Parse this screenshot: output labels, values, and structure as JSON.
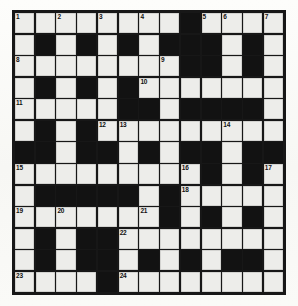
{
  "puzzle": {
    "title": "Crossword Grid",
    "size": {
      "columns": 13,
      "rows": 13
    },
    "colors": {
      "block": "#121212",
      "open_cell": "#ededea",
      "border": "#171717",
      "number_text": "#101010",
      "page_background": "#fbfbf9"
    },
    "legend": {
      "block_label": "blocked-square",
      "open_label": "open-square"
    },
    "clue_numbers": [
      {
        "number": "1",
        "row": 0,
        "col": 0
      },
      {
        "number": "2",
        "row": 0,
        "col": 2
      },
      {
        "number": "3",
        "row": 0,
        "col": 4
      },
      {
        "number": "4",
        "row": 0,
        "col": 6
      },
      {
        "number": "5",
        "row": 0,
        "col": 9
      },
      {
        "number": "6",
        "row": 0,
        "col": 10
      },
      {
        "number": "7",
        "row": 0,
        "col": 12
      },
      {
        "number": "8",
        "row": 2,
        "col": 0
      },
      {
        "number": "9",
        "row": 2,
        "col": 7
      },
      {
        "number": "10",
        "row": 3,
        "col": 6
      },
      {
        "number": "11",
        "row": 4,
        "col": 0
      },
      {
        "number": "12",
        "row": 5,
        "col": 4
      },
      {
        "number": "13",
        "row": 5,
        "col": 5
      },
      {
        "number": "14",
        "row": 5,
        "col": 10
      },
      {
        "number": "15",
        "row": 7,
        "col": 0
      },
      {
        "number": "16",
        "row": 7,
        "col": 8
      },
      {
        "number": "17",
        "row": 7,
        "col": 12
      },
      {
        "number": "18",
        "row": 8,
        "col": 8
      },
      {
        "number": "19",
        "row": 9,
        "col": 0
      },
      {
        "number": "20",
        "row": 9,
        "col": 2
      },
      {
        "number": "21",
        "row": 9,
        "col": 6
      },
      {
        "number": "22",
        "row": 10,
        "col": 5
      },
      {
        "number": "23",
        "row": 12,
        "col": 0
      },
      {
        "number": "24",
        "row": 12,
        "col": 5
      }
    ],
    "grid": [
      [
        0,
        0,
        0,
        0,
        0,
        0,
        0,
        0,
        1,
        0,
        0,
        0,
        0
      ],
      [
        0,
        1,
        0,
        1,
        0,
        1,
        0,
        1,
        1,
        1,
        0,
        1,
        0
      ],
      [
        0,
        0,
        0,
        0,
        0,
        0,
        0,
        0,
        1,
        1,
        0,
        1,
        0
      ],
      [
        0,
        1,
        0,
        1,
        0,
        1,
        0,
        0,
        0,
        0,
        0,
        0,
        0
      ],
      [
        0,
        0,
        0,
        0,
        0,
        1,
        1,
        0,
        1,
        1,
        1,
        1,
        0
      ],
      [
        0,
        1,
        0,
        1,
        0,
        0,
        0,
        0,
        0,
        0,
        0,
        0,
        0
      ],
      [
        1,
        1,
        0,
        1,
        1,
        0,
        1,
        0,
        1,
        1,
        0,
        1,
        1
      ],
      [
        0,
        0,
        0,
        0,
        0,
        0,
        0,
        0,
        0,
        1,
        0,
        1,
        0
      ],
      [
        0,
        1,
        1,
        1,
        1,
        1,
        0,
        1,
        0,
        0,
        0,
        0,
        0
      ],
      [
        0,
        0,
        0,
        0,
        0,
        0,
        0,
        1,
        0,
        1,
        0,
        1,
        0
      ],
      [
        0,
        1,
        0,
        1,
        1,
        0,
        0,
        0,
        0,
        0,
        0,
        0,
        0
      ],
      [
        0,
        1,
        0,
        1,
        1,
        0,
        1,
        0,
        1,
        0,
        1,
        1,
        0
      ],
      [
        0,
        0,
        0,
        0,
        1,
        0,
        0,
        0,
        0,
        0,
        0,
        0,
        0
      ]
    ]
  }
}
